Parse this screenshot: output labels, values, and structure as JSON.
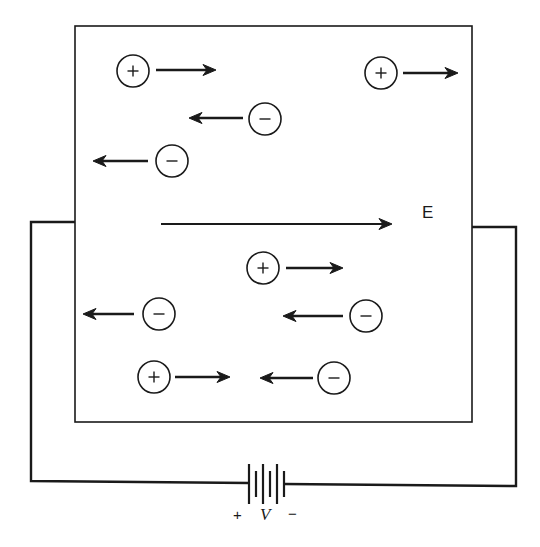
{
  "diagram": {
    "colors": {
      "ink": "#1a1a1a",
      "background": "#ffffff"
    },
    "field": {
      "label": "E",
      "direction": "right",
      "arrow": {
        "x1": 161,
        "x2": 392,
        "y": 224
      }
    },
    "battery": {
      "labels": {
        "positive": "+",
        "voltage": "V",
        "negative": "−"
      },
      "plates": [
        {
          "x": 249,
          "kind": "long"
        },
        {
          "x": 256,
          "kind": "short"
        },
        {
          "x": 263,
          "kind": "long"
        },
        {
          "x": 270,
          "kind": "short"
        },
        {
          "x": 277,
          "kind": "long"
        },
        {
          "x": 284,
          "kind": "short"
        }
      ]
    },
    "box": {
      "x1": 75,
      "y1": 26,
      "x2": 472,
      "y2": 422
    },
    "circuit": {
      "left_wire": [
        [
          75,
          222
        ],
        [
          31,
          222
        ],
        [
          31,
          481
        ],
        [
          249,
          483
        ]
      ],
      "right_wire": [
        [
          472,
          227
        ],
        [
          516,
          227
        ],
        [
          516,
          486
        ],
        [
          284,
          484
        ]
      ]
    },
    "charges": [
      {
        "sign": "+",
        "symbol": "+",
        "cx": 133,
        "cy": 71,
        "arrow": {
          "from": 156,
          "to": 216,
          "y": 70
        }
      },
      {
        "sign": "-",
        "symbol": "−",
        "cx": 265,
        "cy": 119,
        "arrow": {
          "from": 243,
          "to": 189,
          "y": 118
        }
      },
      {
        "sign": "-",
        "symbol": "−",
        "cx": 172,
        "cy": 161,
        "arrow": {
          "from": 148,
          "to": 93,
          "y": 161
        }
      },
      {
        "sign": "+",
        "symbol": "+",
        "cx": 381,
        "cy": 73,
        "arrow": {
          "from": 403,
          "to": 458,
          "y": 73
        }
      },
      {
        "sign": "+",
        "symbol": "+",
        "cx": 263,
        "cy": 268,
        "arrow": {
          "from": 286,
          "to": 343,
          "y": 268
        }
      },
      {
        "sign": "-",
        "symbol": "−",
        "cx": 366,
        "cy": 316,
        "arrow": {
          "from": 343,
          "to": 283,
          "y": 316
        }
      },
      {
        "sign": "-",
        "symbol": "−",
        "cx": 159,
        "cy": 314,
        "arrow": {
          "from": 134,
          "to": 83,
          "y": 314
        }
      },
      {
        "sign": "+",
        "symbol": "+",
        "cx": 154,
        "cy": 377,
        "arrow": {
          "from": 175,
          "to": 230,
          "y": 377
        }
      },
      {
        "sign": "-",
        "symbol": "−",
        "cx": 334,
        "cy": 378,
        "arrow": {
          "from": 313,
          "to": 260,
          "y": 378
        }
      }
    ]
  }
}
